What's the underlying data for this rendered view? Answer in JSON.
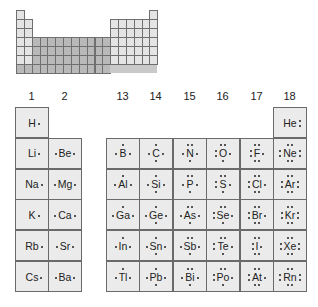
{
  "mini_table": {
    "rows": 7,
    "cols": 18,
    "colors": {
      "s_block": "#e4e4e4",
      "d_block": "#b9b9b9",
      "p_block": "#e4e4e4",
      "period7": "#b9b9b9",
      "border": "#6f6f6f"
    }
  },
  "group_headers": [
    "1",
    "2",
    "13",
    "14",
    "15",
    "16",
    "17",
    "18"
  ],
  "colors": {
    "cell_fill": "#ebebeb",
    "cell_border": "#6a6a6a",
    "text": "#222222"
  },
  "elements": [
    {
      "symbol": "H",
      "group": 1,
      "period": 1,
      "dots": {
        "t": 0,
        "r": 1,
        "b": 0,
        "l": 0
      }
    },
    {
      "symbol": "He",
      "group": 18,
      "period": 1,
      "dots": {
        "t": 0,
        "r": 2,
        "b": 0,
        "l": 0
      }
    },
    {
      "symbol": "Li",
      "group": 1,
      "period": 2,
      "dots": {
        "t": 0,
        "r": 1,
        "b": 0,
        "l": 0
      }
    },
    {
      "symbol": "Be",
      "group": 2,
      "period": 2,
      "dots": {
        "t": 0,
        "r": 1,
        "b": 0,
        "l": 1
      }
    },
    {
      "symbol": "B",
      "group": 13,
      "period": 2,
      "dots": {
        "t": 1,
        "r": 1,
        "b": 0,
        "l": 1
      }
    },
    {
      "symbol": "C",
      "group": 14,
      "period": 2,
      "dots": {
        "t": 1,
        "r": 1,
        "b": 1,
        "l": 1
      }
    },
    {
      "symbol": "N",
      "group": 15,
      "period": 2,
      "dots": {
        "t": 2,
        "r": 1,
        "b": 1,
        "l": 1
      }
    },
    {
      "symbol": "O",
      "group": 16,
      "period": 2,
      "dots": {
        "t": 2,
        "r": 1,
        "b": 1,
        "l": 2
      }
    },
    {
      "symbol": "F",
      "group": 17,
      "period": 2,
      "dots": {
        "t": 2,
        "r": 1,
        "b": 2,
        "l": 2
      }
    },
    {
      "symbol": "Ne",
      "group": 18,
      "period": 2,
      "dots": {
        "t": 2,
        "r": 2,
        "b": 2,
        "l": 2
      }
    },
    {
      "symbol": "Na",
      "group": 1,
      "period": 3,
      "dots": {
        "t": 0,
        "r": 1,
        "b": 0,
        "l": 0
      }
    },
    {
      "symbol": "Mg",
      "group": 2,
      "period": 3,
      "dots": {
        "t": 0,
        "r": 1,
        "b": 0,
        "l": 1
      }
    },
    {
      "symbol": "Al",
      "group": 13,
      "period": 3,
      "dots": {
        "t": 1,
        "r": 1,
        "b": 0,
        "l": 1
      }
    },
    {
      "symbol": "Si",
      "group": 14,
      "period": 3,
      "dots": {
        "t": 1,
        "r": 1,
        "b": 1,
        "l": 1
      }
    },
    {
      "symbol": "P",
      "group": 15,
      "period": 3,
      "dots": {
        "t": 2,
        "r": 1,
        "b": 1,
        "l": 1
      }
    },
    {
      "symbol": "S",
      "group": 16,
      "period": 3,
      "dots": {
        "t": 2,
        "r": 1,
        "b": 1,
        "l": 2
      }
    },
    {
      "symbol": "Cl",
      "group": 17,
      "period": 3,
      "dots": {
        "t": 2,
        "r": 1,
        "b": 2,
        "l": 2
      }
    },
    {
      "symbol": "Ar",
      "group": 18,
      "period": 3,
      "dots": {
        "t": 2,
        "r": 2,
        "b": 2,
        "l": 2
      }
    },
    {
      "symbol": "K",
      "group": 1,
      "period": 4,
      "dots": {
        "t": 0,
        "r": 1,
        "b": 0,
        "l": 0
      }
    },
    {
      "symbol": "Ca",
      "group": 2,
      "period": 4,
      "dots": {
        "t": 0,
        "r": 1,
        "b": 0,
        "l": 1
      }
    },
    {
      "symbol": "Ga",
      "group": 13,
      "period": 4,
      "dots": {
        "t": 1,
        "r": 1,
        "b": 0,
        "l": 1
      }
    },
    {
      "symbol": "Ge",
      "group": 14,
      "period": 4,
      "dots": {
        "t": 1,
        "r": 1,
        "b": 1,
        "l": 1
      }
    },
    {
      "symbol": "As",
      "group": 15,
      "period": 4,
      "dots": {
        "t": 2,
        "r": 1,
        "b": 1,
        "l": 1
      }
    },
    {
      "symbol": "Se",
      "group": 16,
      "period": 4,
      "dots": {
        "t": 2,
        "r": 1,
        "b": 1,
        "l": 2
      }
    },
    {
      "symbol": "Br",
      "group": 17,
      "period": 4,
      "dots": {
        "t": 2,
        "r": 1,
        "b": 2,
        "l": 2
      }
    },
    {
      "symbol": "Kr",
      "group": 18,
      "period": 4,
      "dots": {
        "t": 2,
        "r": 2,
        "b": 2,
        "l": 2
      }
    },
    {
      "symbol": "Rb",
      "group": 1,
      "period": 5,
      "dots": {
        "t": 0,
        "r": 1,
        "b": 0,
        "l": 0
      }
    },
    {
      "symbol": "Sr",
      "group": 2,
      "period": 5,
      "dots": {
        "t": 0,
        "r": 1,
        "b": 0,
        "l": 1
      }
    },
    {
      "symbol": "In",
      "group": 13,
      "period": 5,
      "dots": {
        "t": 1,
        "r": 1,
        "b": 0,
        "l": 1
      }
    },
    {
      "symbol": "Sn",
      "group": 14,
      "period": 5,
      "dots": {
        "t": 1,
        "r": 1,
        "b": 1,
        "l": 1
      }
    },
    {
      "symbol": "Sb",
      "group": 15,
      "period": 5,
      "dots": {
        "t": 2,
        "r": 1,
        "b": 1,
        "l": 1
      }
    },
    {
      "symbol": "Te",
      "group": 16,
      "period": 5,
      "dots": {
        "t": 2,
        "r": 1,
        "b": 1,
        "l": 2
      }
    },
    {
      "symbol": "I",
      "group": 17,
      "period": 5,
      "dots": {
        "t": 2,
        "r": 1,
        "b": 2,
        "l": 2
      }
    },
    {
      "symbol": "Xe",
      "group": 18,
      "period": 5,
      "dots": {
        "t": 2,
        "r": 2,
        "b": 2,
        "l": 2
      }
    },
    {
      "symbol": "Cs",
      "group": 1,
      "period": 6,
      "dots": {
        "t": 0,
        "r": 1,
        "b": 0,
        "l": 0
      }
    },
    {
      "symbol": "Ba",
      "group": 2,
      "period": 6,
      "dots": {
        "t": 0,
        "r": 1,
        "b": 0,
        "l": 1
      }
    },
    {
      "symbol": "Tl",
      "group": 13,
      "period": 6,
      "dots": {
        "t": 1,
        "r": 1,
        "b": 0,
        "l": 1
      }
    },
    {
      "symbol": "Pb",
      "group": 14,
      "period": 6,
      "dots": {
        "t": 1,
        "r": 1,
        "b": 1,
        "l": 1
      }
    },
    {
      "symbol": "Bi",
      "group": 15,
      "period": 6,
      "dots": {
        "t": 2,
        "r": 1,
        "b": 1,
        "l": 1
      }
    },
    {
      "symbol": "Po",
      "group": 16,
      "period": 6,
      "dots": {
        "t": 2,
        "r": 1,
        "b": 1,
        "l": 2
      }
    },
    {
      "symbol": "At",
      "group": 17,
      "period": 6,
      "dots": {
        "t": 2,
        "r": 1,
        "b": 2,
        "l": 2
      }
    },
    {
      "symbol": "Rn",
      "group": 18,
      "period": 6,
      "dots": {
        "t": 2,
        "r": 2,
        "b": 2,
        "l": 2
      }
    }
  ]
}
